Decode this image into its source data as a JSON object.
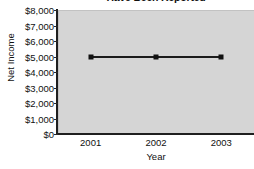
{
  "chart_data": {
    "type": "line",
    "title": "Have Been Reported",
    "xlabel": "Year",
    "ylabel": "Net Income",
    "categories": [
      "2001",
      "2002",
      "2003"
    ],
    "x": [
      2001,
      2002,
      2003
    ],
    "values": [
      5000,
      5000,
      5000
    ],
    "series": [
      {
        "name": "Net Income",
        "values": [
          5000,
          5000,
          5000
        ]
      }
    ],
    "ylim": [
      0,
      8000
    ],
    "ytick_values": [
      0,
      1000,
      2000,
      3000,
      4000,
      5000,
      6000,
      7000,
      8000
    ],
    "ytick_labels": [
      "$0",
      "$1,000",
      "$2,000",
      "$3,000",
      "$4,000",
      "$5,000",
      "$6,000",
      "$7,000",
      "$8,000"
    ],
    "grid": false,
    "legend": false,
    "legend_position": "none",
    "marker": "square",
    "line_color": "#1b1b1b",
    "plot_background": "#d5d5d5",
    "figure_background": "#ffffff",
    "axis_color": "#1f1f1f"
  }
}
